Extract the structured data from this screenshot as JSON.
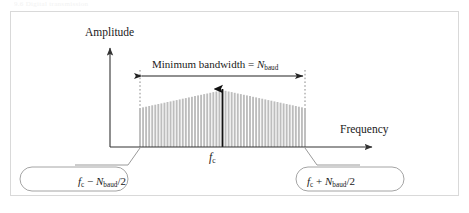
{
  "figure": {
    "top_caption_fragment": "9.6   Digital transmission",
    "background_color": "#ffffff",
    "frame_border_color": "#d9d9d9"
  },
  "axes": {
    "y_axis_label": "Amplitude",
    "x_axis_label": "Frequency",
    "axis_color": "#333333"
  },
  "annotations": {
    "bandwidth_label_prefix": "Minimum bandwidth",
    "bandwidth_label_equals": " = ",
    "bandwidth_symbol_base": "N",
    "bandwidth_symbol_subscript": "baud",
    "center_frequency_base": "f",
    "center_frequency_subscript": "c"
  },
  "callouts": {
    "lower": {
      "base": "f",
      "subscript": "c",
      "operator": " − ",
      "term_base": "N",
      "term_subscript": "baud",
      "divisor": "/2"
    },
    "upper": {
      "base": "f",
      "subscript": "c",
      "operator": " + ",
      "term_base": "N",
      "term_subscript": "baud",
      "divisor": "/2"
    },
    "border_color": "#9a9a9a"
  },
  "chart_data": {
    "type": "bar",
    "xlabel": "Frequency",
    "ylabel": "Amplitude",
    "grid": false,
    "legend": null,
    "x_tick_labels": [
      "f_c − N_baud/2",
      "f_c",
      "f_c + N_baud/2"
    ],
    "x_tick_positions": [
      140,
      222.5,
      305
    ],
    "axis_baseline_y": 147,
    "envelope": {
      "shape": "triangular",
      "left_edge_x": 140,
      "right_edge_x": 305,
      "peak_x": 222.5,
      "edge_height": 39,
      "peak_height": 57
    },
    "carrier_impulse": {
      "x": 222.5,
      "height": 67,
      "color": "#111111",
      "arrowhead": true
    },
    "line_count": 55,
    "line_color": "#bdbdbd",
    "values": [
      39,
      39.7,
      40.3,
      41.0,
      41.7,
      42.3,
      43.0,
      43.6,
      44.3,
      45.0,
      45.6,
      46.3,
      46.9,
      47.6,
      48.3,
      48.9,
      49.6,
      50.2,
      50.9,
      51.6,
      52.2,
      52.9,
      53.5,
      54.2,
      54.9,
      55.5,
      56.2,
      57.0,
      56.2,
      55.5,
      54.9,
      54.2,
      53.5,
      52.9,
      52.2,
      51.6,
      50.9,
      50.2,
      49.6,
      48.9,
      48.3,
      47.6,
      46.9,
      46.3,
      45.6,
      45.0,
      44.3,
      43.6,
      43.0,
      42.3,
      41.7,
      41.0,
      40.3,
      39.7,
      39.0
    ],
    "ylim": [
      0,
      67
    ],
    "xlim": [
      110,
      360
    ]
  }
}
